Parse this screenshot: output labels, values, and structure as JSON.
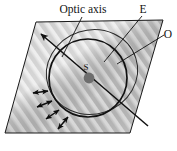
{
  "figure": {
    "name": "double-refraction-wavefronts",
    "background_color": "#ffffff",
    "slab_fill": "#c9c9c9",
    "stripe_light": "#e2e2e2",
    "stripe_dark": "#b4b4b4",
    "line_color": "#1a1a1a",
    "source_dot_color": "#6e6e6e"
  },
  "labels": {
    "optic_axis": "Optic axis",
    "e_ray": "E",
    "o_ray": "O",
    "source": "S"
  },
  "geometry": {
    "slab_vertices": "36,22 163,20 130,133 5,133",
    "optic_axis_line": {
      "x1": 40,
      "y1": 33,
      "x2": 148,
      "y2": 126
    },
    "o_circle": {
      "cx": 88,
      "cy": 78,
      "r": 39
    },
    "e_ellipse": {
      "cx": 92,
      "cy": 72,
      "rx": 46,
      "ry": 42,
      "rotate": -18
    }
  },
  "polarization_arrows": [
    {
      "cx": 41,
      "cy": 92,
      "angle": 188,
      "len": 15
    },
    {
      "cx": 44,
      "cy": 103,
      "angle": 203,
      "len": 16
    },
    {
      "cx": 51,
      "cy": 113,
      "angle": 219,
      "len": 16
    },
    {
      "cx": 60,
      "cy": 120,
      "angle": 236,
      "len": 16
    }
  ]
}
